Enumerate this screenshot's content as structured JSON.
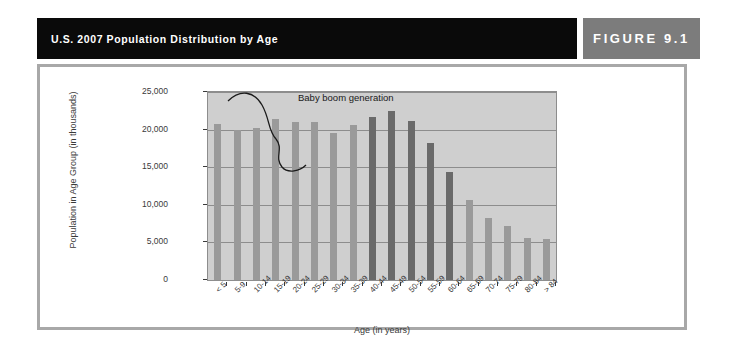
{
  "header": {
    "title": "U.S. 2007 Population Distribution by Age",
    "figure_label": "FIGURE 9.1"
  },
  "colors": {
    "title_bar": "#0a0a0a",
    "figure_box": "#7c7c7c",
    "frame_border": "#a8a8a8",
    "plot_background": "#cfcfcf",
    "bar_light": "#9a9a9a",
    "bar_dark": "#6a6a6a",
    "gridline": "#8d8d8d",
    "text": "#3a3a3a"
  },
  "chart_data": {
    "type": "bar",
    "title": "U.S. 2007 Population Distribution by Age",
    "xlabel": "Age (in years)",
    "ylabel": "Population in Age Group (in thousands)",
    "ylim": [
      0,
      25000
    ],
    "yticks": [
      0,
      5000,
      10000,
      15000,
      20000,
      25000
    ],
    "ytick_labels": [
      "0",
      "5,000",
      "10,000",
      "15,000",
      "20,000",
      "25,000"
    ],
    "grid": true,
    "legend": "none",
    "categories": [
      "< 5",
      "5-9",
      "10-14",
      "15-19",
      "20-24",
      "25-29",
      "30-34",
      "35-39",
      "40-44",
      "45-49",
      "50-54",
      "55-59",
      "60-64",
      "65-69",
      "70-74",
      "75-79",
      "80-84",
      "> 84"
    ],
    "values": [
      20700,
      19900,
      20200,
      21400,
      21000,
      21000,
      19500,
      20600,
      21700,
      22500,
      21200,
      18200,
      14300,
      10700,
      8300,
      7200,
      5600,
      5400
    ],
    "highlight": [
      false,
      false,
      false,
      false,
      false,
      false,
      false,
      false,
      true,
      true,
      true,
      true,
      true,
      false,
      false,
      false,
      false,
      false
    ],
    "annotations": [
      {
        "text": "Baby boom generation",
        "points_to": "40-44 through 60-64"
      }
    ]
  }
}
